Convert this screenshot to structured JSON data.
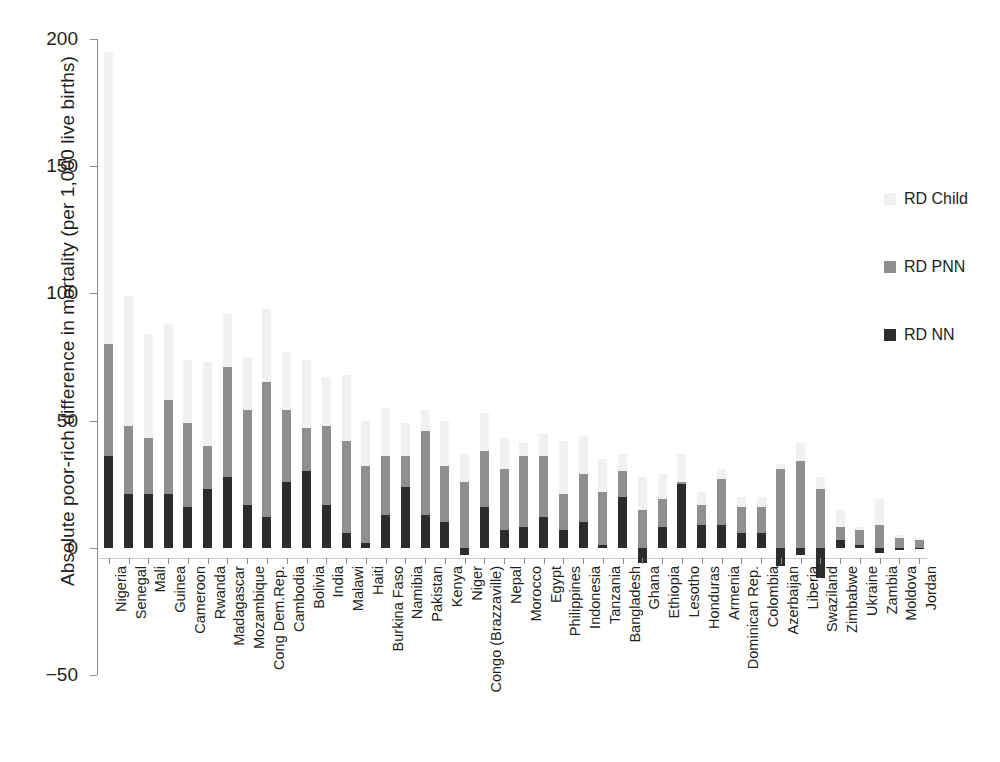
{
  "chart_data": {
    "type": "bar",
    "subtype": "stacked-bar",
    "title": "",
    "xlabel": "",
    "ylabel": "Absolute poor-rich difference in mortality (per 1,000 live births)",
    "ylim": [
      -50,
      200
    ],
    "yticks": [
      -50,
      0,
      50,
      100,
      150,
      200
    ],
    "ytick_labels": [
      "−50",
      "0",
      "50",
      "100",
      "150",
      "200"
    ],
    "grid": false,
    "legend_position": "right",
    "legend": [
      "RD Child",
      "RD PNN",
      "RD NN"
    ],
    "series_colors": {
      "RD Child": "#f1f1f1",
      "RD PNN": "#8f8f8f",
      "RD NN": "#2c2c2c"
    },
    "categories": [
      "Nigeria",
      "Senegal",
      "Mali",
      "Guinea",
      "Cameroon",
      "Rwanda",
      "Madagascar",
      "Mozambique",
      "Cong Dem.Rep.",
      "Cambodia",
      "Bolivia",
      "India",
      "Malawi",
      "Haiti",
      "Burkina Faso",
      "Namibia",
      "Pakistan",
      "Kenya",
      "Niger",
      "Congo (Brazzaville)",
      "Nepal",
      "Morocco",
      "Egypt",
      "Philippines",
      "Indonesia",
      "Tanzania",
      "Bangladesh",
      "Ghana",
      "Ethiopia",
      "Lesotho",
      "Honduras",
      "Armenia",
      "Dominican Rep.",
      "Colombia",
      "Azerbaijan",
      "Liberia",
      "Swaziland",
      "Zimbabwe",
      "Ukraine",
      "Zambia",
      "Moldova",
      "Jordan"
    ],
    "series": [
      {
        "name": "RD NN",
        "values": [
          36,
          21,
          21,
          21,
          16,
          23,
          28,
          17,
          12,
          26,
          30,
          17,
          6,
          2,
          13,
          24,
          13,
          10,
          -3,
          16,
          7,
          8,
          12,
          7,
          10,
          1,
          20,
          -6,
          8,
          25,
          9,
          9,
          6,
          6,
          -7,
          -3,
          -12,
          3,
          1,
          -2,
          -1,
          0
        ]
      },
      {
        "name": "RD PNN",
        "values": [
          44,
          27,
          22,
          37,
          33,
          17,
          43,
          37,
          53,
          28,
          17,
          31,
          36,
          30,
          23,
          12,
          33,
          22,
          26,
          22,
          24,
          28,
          24,
          14,
          19,
          21,
          10,
          15,
          11,
          1,
          8,
          18,
          10,
          10,
          31,
          34,
          23,
          5,
          6,
          9,
          4,
          3
        ]
      },
      {
        "name": "RD Child",
        "values": [
          115,
          51,
          41,
          30,
          25,
          33,
          21,
          21,
          29,
          23,
          27,
          19,
          26,
          18,
          19,
          13,
          8,
          18,
          11,
          15,
          12,
          5,
          9,
          21,
          15,
          13,
          7,
          13,
          10,
          11,
          5,
          4,
          4,
          4,
          2,
          7,
          5,
          7,
          1,
          10,
          1,
          1
        ]
      }
    ],
    "stacked_totals": [
      195,
      99,
      84,
      88,
      74,
      73,
      92,
      75,
      94,
      77,
      74,
      67,
      68,
      50,
      55,
      49,
      54,
      50,
      34,
      53,
      43,
      41,
      45,
      42,
      44,
      35,
      37,
      22,
      29,
      37,
      22,
      31,
      20,
      20,
      26,
      38,
      16,
      15,
      8,
      17,
      4,
      4
    ]
  },
  "legend": {
    "items": [
      {
        "label": "RD Child",
        "swatch": "child"
      },
      {
        "label": "RD PNN",
        "swatch": "pnn"
      },
      {
        "label": "RD NN",
        "swatch": "nn"
      }
    ]
  },
  "caption": ""
}
